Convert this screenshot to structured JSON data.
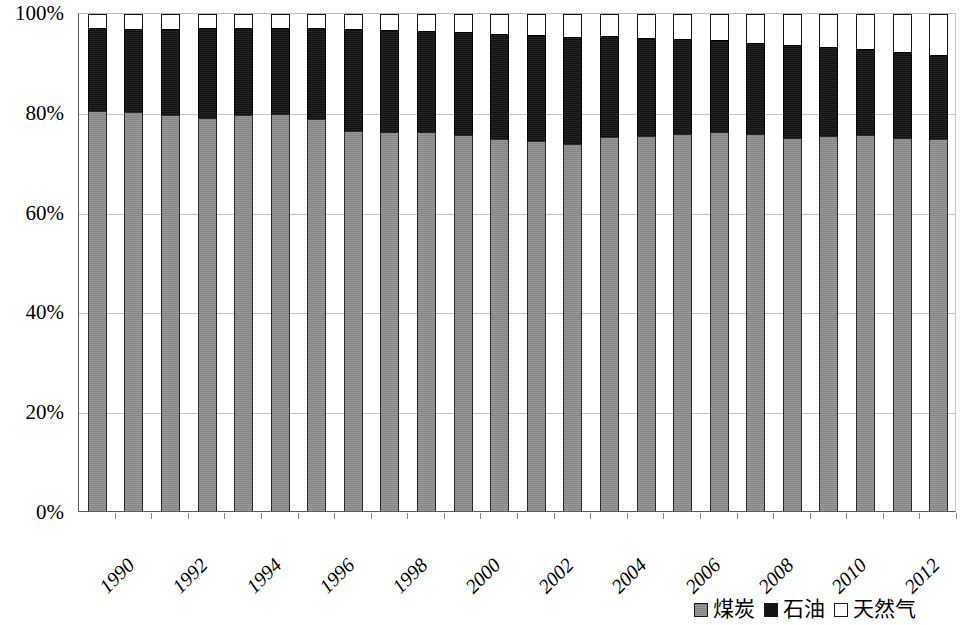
{
  "chart_data": {
    "type": "bar",
    "stacked": true,
    "stack_mode": "percent",
    "title": "",
    "subtitle": "",
    "xlabel": "",
    "ylabel": "",
    "ylim": [
      0,
      100
    ],
    "y_ticks": [
      "0%",
      "20%",
      "40%",
      "60%",
      "80%",
      "100%"
    ],
    "y_tick_values": [
      0,
      20,
      40,
      60,
      80,
      100
    ],
    "grid": true,
    "grid_axis": "y",
    "legend_position": "bottom-right",
    "categories": [
      "1990",
      "1991",
      "1992",
      "1993",
      "1994",
      "1995",
      "1996",
      "1997",
      "1998",
      "1999",
      "2000",
      "2001",
      "2002",
      "2003",
      "2004",
      "2005",
      "2006",
      "2007",
      "2008",
      "2009",
      "2010",
      "2011",
      "2012",
      "2013"
    ],
    "x_tick_labels_shown": [
      "1990",
      "1992",
      "1994",
      "1996",
      "1998",
      "2000",
      "2002",
      "2004",
      "2006",
      "2008",
      "2010",
      "2012"
    ],
    "series": [
      {
        "name": "煤炭",
        "key": "coal",
        "color": "#8a8a8a",
        "pattern": "gray-fill",
        "values": [
          80.2,
          80.0,
          79.4,
          78.8,
          79.3,
          79.6,
          78.5,
          76.1,
          76.0,
          75.9,
          75.3,
          74.5,
          74.2,
          73.5,
          74.9,
          75.1,
          75.6,
          75.9,
          75.5,
          74.7,
          75.1,
          75.3,
          74.7,
          74.5
        ]
      },
      {
        "name": "石油",
        "key": "oil",
        "color": "#141414",
        "pattern": "black-fill",
        "values": [
          16.7,
          16.8,
          17.4,
          18.1,
          17.6,
          17.4,
          18.4,
          20.6,
          20.5,
          20.5,
          20.9,
          21.3,
          21.4,
          21.7,
          20.4,
          19.9,
          19.2,
          18.7,
          18.5,
          18.8,
          18.1,
          17.5,
          17.5,
          17.1
        ]
      },
      {
        "name": "天然气",
        "key": "gas",
        "color": "#ffffff",
        "pattern": "white-fill",
        "values": [
          3.1,
          3.2,
          3.2,
          3.1,
          3.1,
          3.0,
          3.1,
          3.3,
          3.5,
          3.6,
          3.8,
          4.2,
          4.4,
          4.8,
          4.7,
          5.0,
          5.2,
          5.4,
          6.0,
          6.5,
          6.8,
          7.2,
          7.8,
          8.4
        ]
      }
    ]
  },
  "legend": {
    "items": [
      {
        "label": "煤炭",
        "swatch": "coal"
      },
      {
        "label": "石油",
        "swatch": "oil"
      },
      {
        "label": "天然气",
        "swatch": "gas"
      }
    ]
  }
}
